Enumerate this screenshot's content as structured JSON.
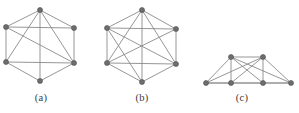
{
  "figure": {
    "width": 299,
    "height": 113,
    "background_color": "#ffffff",
    "edge_color": "#8a8a8a",
    "vertex_fill_color": "#6e6e6e",
    "vertex_stroke_color": "#4a4a4a",
    "caption_color": "#3a3a3a"
  },
  "panels": [
    {
      "id": "a",
      "caption": "(a)",
      "layout": "hexagon",
      "vertex_count": 6,
      "edge_count": 12,
      "vertices": [
        {
          "id": "v0",
          "label": "top",
          "x": 40,
          "y": 10
        },
        {
          "id": "v1",
          "label": "upper-left",
          "x": 6,
          "y": 27
        },
        {
          "id": "v2",
          "label": "upper-right",
          "x": 74,
          "y": 28
        },
        {
          "id": "v3",
          "label": "lower-left",
          "x": 6,
          "y": 62
        },
        {
          "id": "v4",
          "label": "lower-right",
          "x": 74,
          "y": 63
        },
        {
          "id": "v5",
          "label": "bottom",
          "x": 40,
          "y": 81
        }
      ],
      "edges": [
        [
          "v0",
          "v1"
        ],
        [
          "v0",
          "v2"
        ],
        [
          "v0",
          "v3"
        ],
        [
          "v0",
          "v4"
        ],
        [
          "v0",
          "v5"
        ],
        [
          "v1",
          "v2"
        ],
        [
          "v1",
          "v3"
        ],
        [
          "v1",
          "v4"
        ],
        [
          "v2",
          "v4"
        ],
        [
          "v3",
          "v4"
        ],
        [
          "v3",
          "v5"
        ],
        [
          "v4",
          "v5"
        ]
      ]
    },
    {
      "id": "b",
      "caption": "(b)",
      "layout": "hexagon",
      "vertex_count": 6,
      "edge_count": 14,
      "vertices": [
        {
          "id": "v0",
          "label": "top",
          "x": 142,
          "y": 10
        },
        {
          "id": "v1",
          "label": "upper-left",
          "x": 107,
          "y": 28
        },
        {
          "id": "v2",
          "label": "upper-right",
          "x": 176,
          "y": 29
        },
        {
          "id": "v3",
          "label": "lower-left",
          "x": 107,
          "y": 63
        },
        {
          "id": "v4",
          "label": "lower-right",
          "x": 176,
          "y": 64
        },
        {
          "id": "v5",
          "label": "bottom",
          "x": 142,
          "y": 82
        }
      ],
      "edges": [
        [
          "v0",
          "v1"
        ],
        [
          "v0",
          "v2"
        ],
        [
          "v0",
          "v3"
        ],
        [
          "v0",
          "v4"
        ],
        [
          "v0",
          "v5"
        ],
        [
          "v1",
          "v2"
        ],
        [
          "v1",
          "v3"
        ],
        [
          "v1",
          "v4"
        ],
        [
          "v1",
          "v5"
        ],
        [
          "v2",
          "v3"
        ],
        [
          "v2",
          "v4"
        ],
        [
          "v3",
          "v4"
        ],
        [
          "v3",
          "v5"
        ],
        [
          "v4",
          "v5"
        ]
      ]
    },
    {
      "id": "c",
      "caption": "(c)",
      "layout": "trapezoid",
      "vertex_count": 6,
      "edge_count": 13,
      "vertices": [
        {
          "id": "v0",
          "label": "top-left",
          "x": 231,
          "y": 57
        },
        {
          "id": "v1",
          "label": "top-right",
          "x": 263,
          "y": 57
        },
        {
          "id": "v2",
          "label": "bottom-far-left",
          "x": 206,
          "y": 83
        },
        {
          "id": "v3",
          "label": "bottom-left",
          "x": 231,
          "y": 83
        },
        {
          "id": "v4",
          "label": "bottom-right",
          "x": 263,
          "y": 83
        },
        {
          "id": "v5",
          "label": "bottom-far-right",
          "x": 291,
          "y": 83
        }
      ],
      "edges": [
        [
          "v0",
          "v1"
        ],
        [
          "v0",
          "v2"
        ],
        [
          "v0",
          "v3"
        ],
        [
          "v0",
          "v4"
        ],
        [
          "v0",
          "v5"
        ],
        [
          "v1",
          "v2"
        ],
        [
          "v1",
          "v3"
        ],
        [
          "v1",
          "v4"
        ],
        [
          "v1",
          "v5"
        ],
        [
          "v2",
          "v3"
        ],
        [
          "v2",
          "v5"
        ],
        [
          "v3",
          "v4"
        ],
        [
          "v4",
          "v5"
        ]
      ]
    }
  ]
}
